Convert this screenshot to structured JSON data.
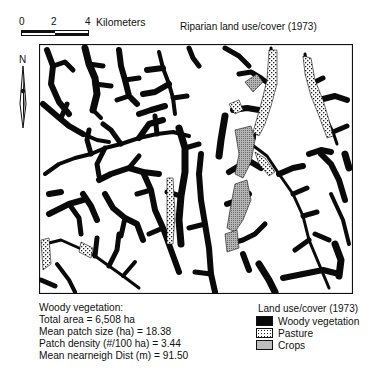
{
  "scale_bar": {
    "ticks": [
      "0",
      "2",
      "4"
    ],
    "unit": "Kilometers"
  },
  "map_title": "Riparian land use/cover (1973)",
  "north_arrow": {
    "label": "N"
  },
  "stats": {
    "heading": "Woody vegetation:",
    "lines": [
      "Total area = 6,508 ha",
      "Mean patch size (ha) = 18.38",
      "Patch density (#/100 ha) = 3.44",
      "Mean nearneigh Dist (m) = 91.50"
    ]
  },
  "legend": {
    "title": "Land use/cover (1973)",
    "items": [
      {
        "label": "Woody vegetation",
        "pattern": "solid-black",
        "color": "#0a0a0a"
      },
      {
        "label": "Pasture",
        "pattern": "dotted-checker",
        "color": "#ffffff"
      },
      {
        "label": "Crops",
        "pattern": "fine-stipple-gray",
        "color": "#9a9a9a"
      }
    ]
  }
}
